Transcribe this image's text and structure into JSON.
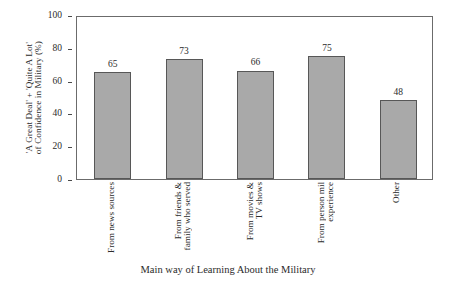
{
  "chart_data": {
    "type": "bar",
    "title": "",
    "categories": [
      "From news sources",
      "From friends & family who served",
      "From movies & TV shows",
      "From person mil experience",
      "Other"
    ],
    "category_lines": [
      [
        "From news sources"
      ],
      [
        "From friends &",
        "family who served"
      ],
      [
        "From movies &",
        "TV shows"
      ],
      [
        "From person mil",
        "experience"
      ],
      [
        "Other"
      ]
    ],
    "values": [
      65,
      73,
      66,
      75,
      48
    ],
    "value_labels": [
      "65",
      "73",
      "66",
      "75",
      "48"
    ],
    "xlabel": "Main way of Learning About the Military",
    "ylabel_lines": [
      "'A Great Deal' + 'Quite A Lot'",
      "of Confidence in Military (%)"
    ],
    "ylabel": "'A Great Deal' + 'Quite A Lot' of Confidence in Military (%)",
    "ylim": [
      0,
      100
    ],
    "yticks": [
      0,
      20,
      40,
      60,
      80,
      100
    ],
    "ytick_labels": [
      "0",
      "20",
      "40",
      "60",
      "80",
      "100"
    ],
    "grid": false,
    "legend": false,
    "colors": {
      "bar_fill": "#a9a9a9",
      "bar_edge": "#575757",
      "frame": "#6b6b6b",
      "text": "#2b2b2b",
      "background": "#ffffff"
    }
  }
}
